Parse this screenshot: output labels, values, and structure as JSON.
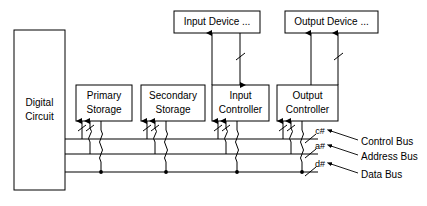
{
  "diagram": {
    "background_color": "#ffffff",
    "line_color": "#000000"
  },
  "boxes": {
    "digital_circuit": {
      "line1": "Digital",
      "line2": "Circuit"
    },
    "primary_storage": {
      "line1": "Primary",
      "line2": "Storage"
    },
    "secondary_storage": {
      "line1": "Secondary",
      "line2": "Storage"
    },
    "input_controller": {
      "line1": "Input",
      "line2": "Controller"
    },
    "output_controller": {
      "line1": "Output",
      "line2": "Controller"
    },
    "input_device": {
      "line1": "Input Device ..."
    },
    "output_device": {
      "line1": "Output Device ..."
    }
  },
  "buses": [
    {
      "tag": "c#",
      "name": "Control Bus"
    },
    {
      "tag": "a#",
      "name": "Address Bus"
    },
    {
      "tag": "d#",
      "name": "Data Bus"
    }
  ]
}
